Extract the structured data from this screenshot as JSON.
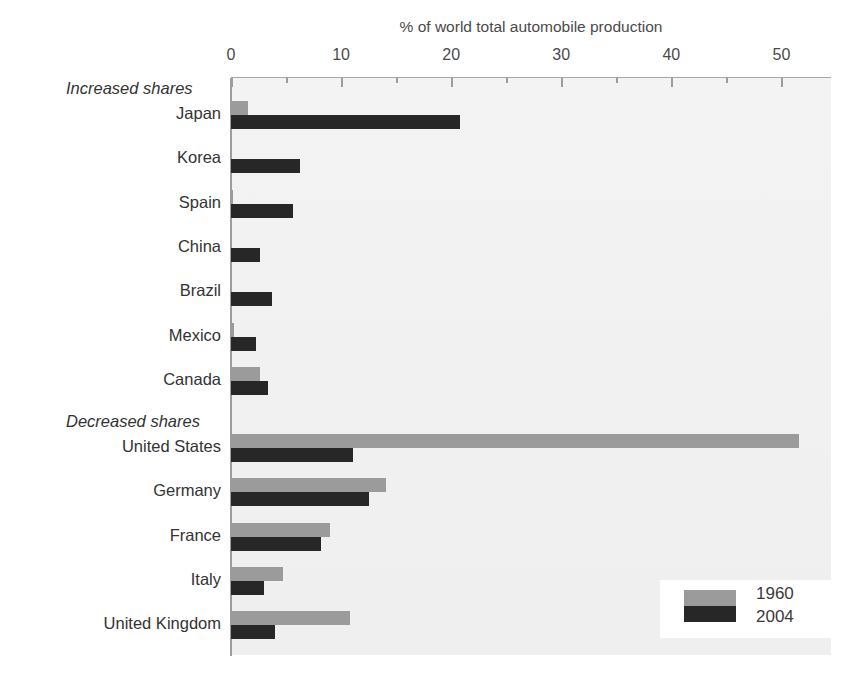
{
  "chart_data": {
    "type": "bar",
    "orientation": "horizontal",
    "title": "% of world total automobile production",
    "xlabel": "% of world total automobile production",
    "ylabel": "",
    "xlim": [
      0,
      54.5
    ],
    "xticks": [
      0,
      10,
      20,
      30,
      40,
      50
    ],
    "xtick_labels": [
      "0",
      "10",
      "20",
      "30",
      "40",
      "50"
    ],
    "minor_tick_step": 5,
    "grid": false,
    "legend_position": "bottom-right",
    "series": [
      {
        "name": "1960",
        "color": "#9b9b9b",
        "values": [
          1.5,
          0.0,
          0.2,
          0.0,
          0.0,
          0.3,
          2.6,
          51.6,
          14.1,
          9.0,
          4.7,
          10.8
        ]
      },
      {
        "name": "2004",
        "color": "#272727",
        "values": [
          20.8,
          6.3,
          5.6,
          2.6,
          3.7,
          2.3,
          3.4,
          11.1,
          12.5,
          8.2,
          3.0,
          4.0
        ]
      }
    ],
    "categories": [
      "Japan",
      "Korea",
      "Spain",
      "China",
      "Brazil",
      "Mexico",
      "Canada",
      "United States",
      "Germany",
      "France",
      "Italy",
      "United Kingdom"
    ],
    "groups": [
      {
        "label": "Increased shares",
        "categories": [
          "Japan",
          "Korea",
          "Spain",
          "China",
          "Brazil",
          "Mexico",
          "Canada"
        ]
      },
      {
        "label": "Decreased shares",
        "categories": [
          "United States",
          "Germany",
          "France",
          "Italy",
          "United Kingdom"
        ]
      }
    ]
  },
  "legend": {
    "entries": [
      {
        "label": "1960"
      },
      {
        "label": "2004"
      }
    ]
  },
  "colors": {
    "series_1960": "#9b9b9b",
    "series_2004": "#272727",
    "plot_background": "#f1f1f1",
    "axis": "#9d9d9d"
  }
}
